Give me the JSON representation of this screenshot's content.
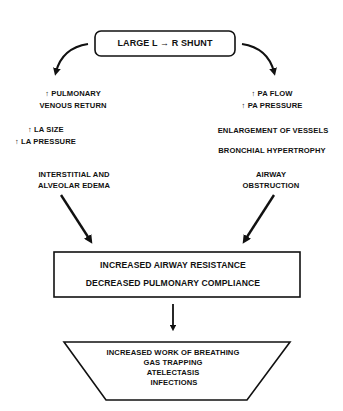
{
  "diagram": {
    "title_box": {
      "label": "LARGE L → R SHUNT",
      "shape": "rounded-rectangle"
    },
    "left_branch": {
      "step1": [
        "↑ PULMONARY",
        "VENOUS RETURN"
      ],
      "step2": [
        "↑ LA SIZE",
        "↑ LA PRESSURE"
      ],
      "step3": [
        "INTERSTITIAL AND",
        "ALVEOLAR EDEMA"
      ]
    },
    "right_branch": {
      "step1": [
        "↑ PA FLOW",
        "↑ PA PRESSURE"
      ],
      "step2": [
        "ENLARGEMENT OF VESSELS"
      ],
      "step3": [
        "BRONCHIAL HYPERTROPHY"
      ],
      "step4": [
        "AIRWAY",
        "OBSTRUCTION"
      ]
    },
    "middle_box": {
      "shape": "rectangle",
      "lines": [
        "INCREASED AIRWAY RESISTANCE",
        "DECREASED PULMONARY COMPLIANCE"
      ]
    },
    "bottom_box": {
      "shape": "inverted-trapezoid",
      "lines": [
        "INCREASED WORK OF BREATHING",
        "GAS TRAPPING",
        "ATELECTASIS",
        "INFECTIONS"
      ]
    },
    "colors": {
      "stroke": "#111111",
      "background": "#ffffff",
      "text": "#111111"
    }
  }
}
